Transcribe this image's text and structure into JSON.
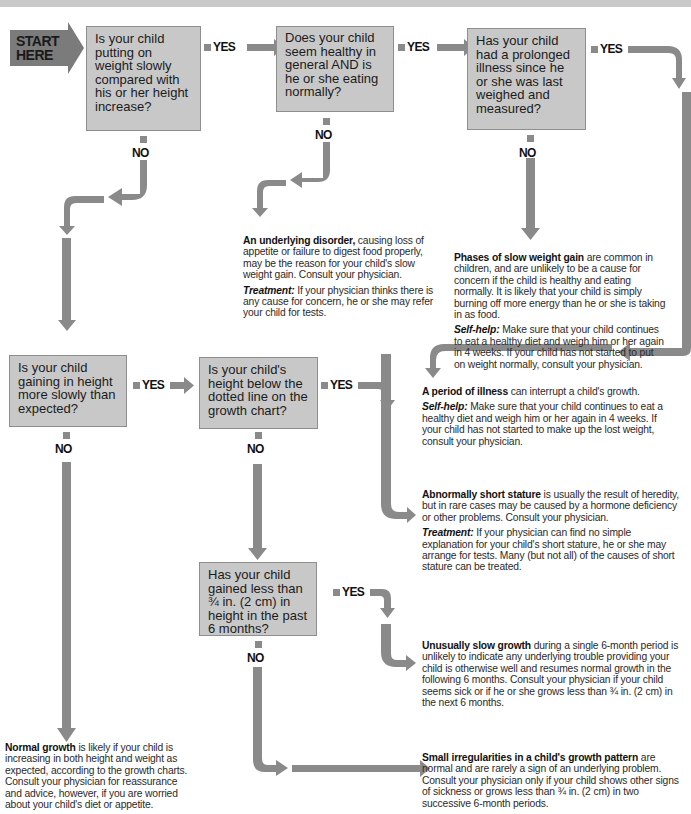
{
  "header": {
    "title": "Slow weight gain"
  },
  "start": {
    "line1": "START",
    "line2": "HERE"
  },
  "questions": [
    {
      "id": "q1",
      "text": "Is your child putting on weight slowly compared with his or her height increase?"
    },
    {
      "id": "q2",
      "text": "Does your child seem healthy in general AND is he or she eating normally?"
    },
    {
      "id": "q3",
      "text": "Has your child had a prolonged illness since he or she was last weighed and measured?"
    },
    {
      "id": "q4",
      "text": "Is your child gaining in height more slowly than expected?"
    },
    {
      "id": "q5",
      "text": "Is your child's height below the dotted line on the growth chart?"
    },
    {
      "id": "q6",
      "text": "Has your child gained less than ¾ in. (2 cm) in height in the past 6 months?"
    }
  ],
  "labels": {
    "yes": "YES",
    "no": "NO"
  },
  "results": {
    "underlying_disorder": {
      "heading": "An underlying disorder,",
      "body": " causing loss of appetite or failure to digest food properly, may be the reason for your child's slow weight gain. Consult your physician.",
      "sub_heading": "Treatment:",
      "sub_body": " If your physician thinks there is any cause for concern, he or she may refer your child for tests."
    },
    "phases_slow_weight": {
      "heading": "Phases of slow weight gain",
      "body": " are common in children, and are unlikely to be a cause for concern if the child is healthy and eating normally. It is likely that your child is simply burning off more energy than he or she is taking in as food.",
      "sub_heading": "Self-help:",
      "sub_body": " Make sure that your child continues to eat a healthy diet and weigh him or her again in 4 weeks. If your child has not started to put on weight normally, consult your physician."
    },
    "period_of_illness": {
      "heading": "A period of illness",
      "body": " can interrupt a child's growth.",
      "sub_heading": "Self-help:",
      "sub_body": " Make sure that your child continues to eat a healthy diet and weigh him or her again in 4 weeks. If your child has not started to make up the lost weight, consult your physician."
    },
    "short_stature": {
      "heading": "Abnormally short stature",
      "body": " is usually the result of heredity, but in rare cases may be caused by a hormone deficiency or other problems. Consult your physician.",
      "sub_heading": "Treatment:",
      "sub_body": " If your physician can find no simple explanation for your child's short stature, he or she may arrange for tests. Many (but not all) of the causes of short stature can be treated."
    },
    "slow_growth": {
      "heading": "Unusually slow growth",
      "body": " during a single 6-month period is unlikely to indicate any underlying trouble providing your child is otherwise well and resumes normal growth in the following 6 months. Consult your physician if your child seems sick or if he or she grows less than ¾ in. (2 cm) in the next 6 months."
    },
    "normal_growth": {
      "heading": "Normal growth",
      "body": " is likely if your child is increasing in both height and weight as expected, according to the growth charts. Consult your physician for reassurance and advice, however, if you are worried about your child's diet or appetite."
    },
    "small_irregularities": {
      "heading": "Small irregularities in a child's growth pattern",
      "body": " are normal and are rarely a sign of an underlying problem. Consult your physician only if your child shows other signs of sickness or grows less than ¾ in. (2 cm) in two successive 6-month periods."
    }
  },
  "colors": {
    "arrow": "#8a8a8a",
    "box_fill": "#c8c8c8",
    "box_border": "#8e8e8e",
    "start_fill": "#7b7b7b",
    "header_bar": "#c9c9c9"
  }
}
